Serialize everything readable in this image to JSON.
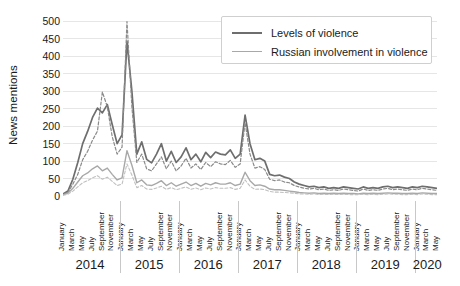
{
  "chart_data": {
    "type": "line",
    "title": "",
    "xlabel": "",
    "ylabel": "News mentions",
    "ylim": [
      0,
      510
    ],
    "yticks": [
      0,
      50,
      100,
      150,
      200,
      250,
      300,
      350,
      400,
      450,
      500
    ],
    "grid": true,
    "legend_position": "top-right",
    "legend": [
      {
        "name": "Levels of violence",
        "color": "#6e6e6e",
        "style": "solid"
      },
      {
        "name": "Russian involvement in violence",
        "color": "#a8a8a8",
        "style": "solid"
      }
    ],
    "years": [
      {
        "label": "2014",
        "months": 12
      },
      {
        "label": "2015",
        "months": 12
      },
      {
        "label": "2016",
        "months": 12
      },
      {
        "label": "2017",
        "months": 12
      },
      {
        "label": "2018",
        "months": 12
      },
      {
        "label": "2019",
        "months": 12
      },
      {
        "label": "2020",
        "months": 5
      }
    ],
    "month_tick_labels": [
      "January",
      "March",
      "May",
      "July",
      "September",
      "November"
    ],
    "month_tick_positions": [
      0,
      2,
      4,
      6,
      8,
      10
    ],
    "x_start": "January 2014",
    "x_end": "May 2020",
    "series": [
      {
        "name": "Levels of violence",
        "color": "#6e6e6e",
        "style": "solid",
        "width": 1.7,
        "values": [
          6,
          14,
          48,
          96,
          150,
          185,
          225,
          252,
          238,
          262,
          205,
          150,
          175,
          443,
          300,
          120,
          155,
          105,
          95,
          120,
          150,
          100,
          128,
          96,
          112,
          138,
          104,
          120,
          98,
          125,
          110,
          126,
          120,
          118,
          132,
          108,
          120,
          232,
          150,
          104,
          108,
          100,
          62,
          58,
          60,
          54,
          50,
          40,
          34,
          30,
          26,
          28,
          24,
          26,
          22,
          24,
          22,
          26,
          24,
          22,
          20,
          26,
          22,
          24,
          22,
          26,
          28,
          24,
          26,
          24,
          22,
          26,
          24,
          28,
          26,
          24,
          22
        ]
      },
      {
        "name": "Levels of violence (variant)",
        "color": "#8a8a8a",
        "style": "dashed",
        "width": 1.2,
        "values": [
          4,
          10,
          34,
          62,
          104,
          128,
          160,
          186,
          298,
          256,
          170,
          120,
          140,
          500,
          255,
          96,
          120,
          78,
          72,
          92,
          112,
          78,
          100,
          72,
          86,
          108,
          80,
          92,
          76,
          96,
          84,
          98,
          92,
          90,
          102,
          82,
          92,
          210,
          120,
          80,
          84,
          76,
          48,
          44,
          46,
          40,
          38,
          30,
          26,
          22,
          20,
          22,
          18,
          20,
          16,
          18,
          16,
          20,
          18,
          16,
          14,
          20,
          16,
          18,
          16,
          20,
          22,
          18,
          20,
          18,
          16,
          20,
          18,
          22,
          20,
          18,
          16
        ]
      },
      {
        "name": "Russian involvement in violence",
        "color": "#a8a8a8",
        "style": "solid",
        "width": 1.4,
        "values": [
          3,
          8,
          22,
          40,
          58,
          66,
          78,
          86,
          72,
          80,
          62,
          46,
          52,
          130,
          88,
          38,
          46,
          32,
          30,
          36,
          44,
          30,
          38,
          28,
          34,
          40,
          30,
          36,
          28,
          36,
          32,
          38,
          34,
          34,
          38,
          30,
          34,
          68,
          44,
          30,
          32,
          28,
          20,
          18,
          18,
          16,
          14,
          12,
          10,
          9,
          8,
          9,
          7,
          8,
          7,
          8,
          7,
          8,
          7,
          7,
          6,
          8,
          7,
          8,
          7,
          8,
          9,
          8,
          8,
          7,
          7,
          8,
          7,
          9,
          8,
          7,
          7
        ]
      },
      {
        "name": "Russian involvement in violence (variant)",
        "color": "#c0c0c0",
        "style": "dashed",
        "width": 1.1,
        "values": [
          2,
          5,
          14,
          26,
          38,
          44,
          52,
          58,
          48,
          54,
          42,
          30,
          34,
          92,
          60,
          24,
          30,
          20,
          19,
          23,
          28,
          19,
          24,
          18,
          22,
          26,
          19,
          23,
          18,
          23,
          20,
          24,
          22,
          22,
          24,
          19,
          22,
          46,
          28,
          19,
          20,
          18,
          13,
          11,
          11,
          10,
          9,
          8,
          6,
          6,
          5,
          6,
          4,
          5,
          4,
          5,
          4,
          5,
          4,
          4,
          4,
          5,
          4,
          5,
          4,
          5,
          6,
          5,
          5,
          4,
          4,
          5,
          4,
          6,
          5,
          4,
          4
        ]
      }
    ]
  }
}
